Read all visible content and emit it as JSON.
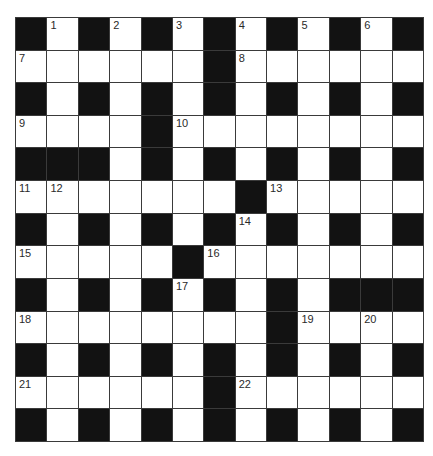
{
  "puzzle": {
    "rows": 13,
    "cols": 13,
    "layout": [
      "#.#.#.#.#.#.#",
      "......#......",
      "#.#.#.#.#.#.#",
      "....#........",
      "###.#.#.#.#.#",
      ".......#.....",
      "#.#.#.#.#.#.#",
      ".....#.......",
      "#.#.#.#.#.###",
      "........#....",
      "#.#.#.#.#.#.#",
      "......#......",
      "#.#.#.#.#.#.#"
    ],
    "numbers": [
      {
        "row": 0,
        "col": 1,
        "n": "1"
      },
      {
        "row": 0,
        "col": 3,
        "n": "2"
      },
      {
        "row": 0,
        "col": 5,
        "n": "3"
      },
      {
        "row": 0,
        "col": 7,
        "n": "4"
      },
      {
        "row": 0,
        "col": 9,
        "n": "5"
      },
      {
        "row": 0,
        "col": 11,
        "n": "6"
      },
      {
        "row": 1,
        "col": 0,
        "n": "7"
      },
      {
        "row": 1,
        "col": 7,
        "n": "8"
      },
      {
        "row": 3,
        "col": 0,
        "n": "9"
      },
      {
        "row": 3,
        "col": 5,
        "n": "10"
      },
      {
        "row": 5,
        "col": 0,
        "n": "11"
      },
      {
        "row": 5,
        "col": 1,
        "n": "12"
      },
      {
        "row": 5,
        "col": 8,
        "n": "13"
      },
      {
        "row": 6,
        "col": 7,
        "n": "14"
      },
      {
        "row": 7,
        "col": 0,
        "n": "15"
      },
      {
        "row": 7,
        "col": 6,
        "n": "16"
      },
      {
        "row": 8,
        "col": 5,
        "n": "17"
      },
      {
        "row": 9,
        "col": 0,
        "n": "18"
      },
      {
        "row": 9,
        "col": 9,
        "n": "19"
      },
      {
        "row": 9,
        "col": 11,
        "n": "20"
      },
      {
        "row": 11,
        "col": 0,
        "n": "21"
      },
      {
        "row": 11,
        "col": 7,
        "n": "22"
      }
    ],
    "colors": {
      "block": "#121212",
      "empty": "#ffffff",
      "line": "#3a3a3a",
      "number": "#2a2a2a"
    }
  }
}
